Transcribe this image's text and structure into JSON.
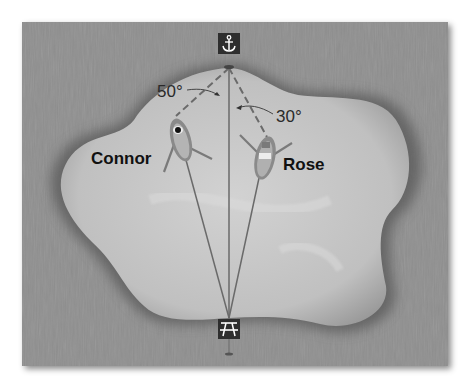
{
  "diagram": {
    "top_icon": "anchor-icon",
    "bottom_icon": "picnic-table-icon",
    "angles": {
      "left": "50°",
      "right": "30°"
    },
    "boats": [
      {
        "name": "Connor"
      },
      {
        "name": "Rose"
      }
    ],
    "colors": {
      "water_outer": "#8f8f8f",
      "lake": "#c4c4c4",
      "lines": "#5a5a5a",
      "icon_bg": "#2e2e2e"
    }
  }
}
